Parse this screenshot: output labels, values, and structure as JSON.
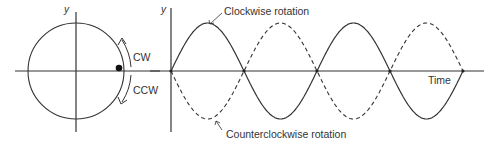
{
  "circle_panel": {
    "y_axis_label": "y",
    "cw_label": "CW",
    "ccw_label": "CCW",
    "center": [
      76,
      71
    ],
    "radius": 48,
    "dot": [
      119,
      68
    ]
  },
  "wave_panel": {
    "y_axis_label": "y",
    "x_axis_label": "Time",
    "solid_label": "Clockwise rotation",
    "dashed_label": "Counterclockwise rotation",
    "origin": [
      171,
      71
    ],
    "amplitude": 48,
    "half_period": 73,
    "cycles": 2
  },
  "colors": {
    "line": "#333333",
    "background": "#ffffff"
  }
}
